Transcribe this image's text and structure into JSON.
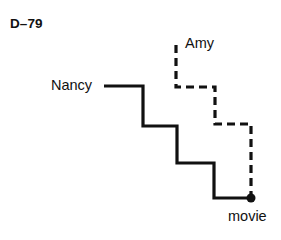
{
  "figure": {
    "plate_label": "D–79",
    "width": 281,
    "height": 240,
    "background_color": "#ffffff",
    "ink_color": "#111111"
  },
  "labels": {
    "nancy": "Nancy",
    "amy": "Amy",
    "movie": "movie"
  },
  "chart_data": {
    "type": "line",
    "title": "D–79",
    "xlabel": "",
    "ylabel": "",
    "grid": false,
    "legend": "inline-endpoint-labels",
    "xlim": [
      0,
      281
    ],
    "ylim": [
      240,
      0
    ],
    "endpoint": {
      "name": "movie",
      "x": 251,
      "y": 198,
      "marker": "filled-circle",
      "radius": 4.5
    },
    "series": [
      {
        "name": "Nancy",
        "stroke": "#111111",
        "stroke_width": 3.2,
        "style": "solid",
        "label_anchor": "start",
        "points": [
          [
            104,
            86
          ],
          [
            143,
            86
          ],
          [
            143,
            126
          ],
          [
            177,
            126
          ],
          [
            177,
            163
          ],
          [
            214,
            163
          ],
          [
            214,
            198
          ],
          [
            251,
            198
          ]
        ]
      },
      {
        "name": "Amy",
        "stroke": "#111111",
        "stroke_width": 3.2,
        "style": "dashed",
        "dash_pattern": "8 5",
        "label_anchor": "start",
        "points": [
          [
            176,
            45
          ],
          [
            176,
            87
          ],
          [
            215,
            87
          ],
          [
            215,
            124
          ],
          [
            251,
            124
          ],
          [
            251,
            198
          ]
        ]
      }
    ]
  }
}
